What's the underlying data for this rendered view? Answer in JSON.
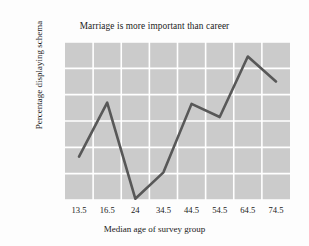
{
  "chart_data": {
    "type": "line",
    "title": "Marriage is more important than career",
    "xlabel": "Median age of survey group",
    "ylabel": "Percentage displaying schema",
    "categories": [
      "13.5",
      "16.5",
      "24",
      "34.5",
      "44.5",
      "54.5",
      "64.5",
      "74.5"
    ],
    "x": [
      13.5,
      16.5,
      24,
      34.5,
      44.5,
      54.5,
      64.5,
      74.5
    ],
    "values": [
      46.5,
      67,
      30.5,
      40.5,
      66.5,
      61.5,
      84.5,
      75
    ],
    "series": [
      {
        "name": "Percentage displaying schema",
        "values": [
          46.5,
          67,
          30.5,
          40.5,
          66.5,
          61.5,
          84.5,
          75
        ]
      }
    ],
    "ylim": [
      30,
      90
    ],
    "yticks": [
      30,
      40,
      50,
      60,
      70,
      80,
      90
    ],
    "ytick_labels": [
      "30",
      "40",
      "50",
      "60",
      "70",
      "80",
      "90"
    ],
    "xtick_labels": [
      "13.5",
      "16.5",
      "24",
      "34.5",
      "44.5",
      "54.5",
      "64.5",
      "74.5"
    ],
    "grid": true,
    "legend": false,
    "colors": {
      "line": "#585858",
      "plot_background": "#cbcbcb",
      "gridline": "#ffffff",
      "figure_background": "#fdfdfd",
      "text": "#1a1a1a"
    }
  }
}
